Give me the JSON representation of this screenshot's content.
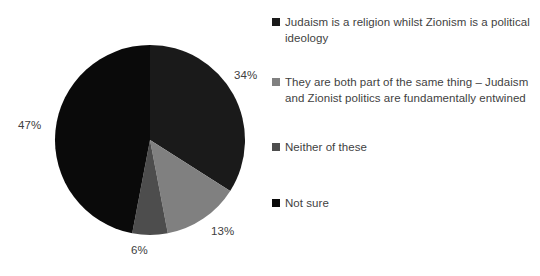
{
  "chart_data": {
    "type": "pie",
    "title": "",
    "subtitle": "",
    "xlabel": "",
    "ylabel": "",
    "legend_position": "right",
    "grid": false,
    "start_angle_deg": 0,
    "direction": "clockwise",
    "categories": [
      "Judaism is a religion whilst Zionism is a political ideology",
      "They are both part of the same thing – Judaism and Zionist politics are fundamentally entwined",
      "Neither of these",
      "Not sure"
    ],
    "values": [
      34,
      13,
      6,
      47
    ],
    "value_labels": [
      "34%",
      "13%",
      "6%",
      "47%"
    ],
    "colors": [
      "#1a1a1a",
      "#808080",
      "#4d4d4d",
      "#0a0a0a"
    ],
    "slices": [
      {
        "label": "Judaism is a religion whilst Zionism is a political ideology",
        "value": 34,
        "value_label": "34%",
        "color": "#1a1a1a"
      },
      {
        "label": "They are both part of the same thing – Judaism and Zionist politics are fundamentally entwined",
        "value": 13,
        "value_label": "13%",
        "color": "#808080"
      },
      {
        "label": "Neither of these",
        "value": 6,
        "value_label": "6%",
        "color": "#4d4d4d"
      },
      {
        "label": "Not sure",
        "value": 47,
        "value_label": "47%",
        "color": "#0a0a0a"
      }
    ]
  },
  "legend": {
    "items": [
      {
        "label": "Judaism is a religion whilst Zionism is a political ideology",
        "color": "#1a1a1a",
        "swatch_icon": "square-swatch-icon"
      },
      {
        "label": "They are both part of the same thing – Judaism and Zionist politics are fundamentally entwined",
        "color": "#808080",
        "swatch_icon": "square-swatch-icon"
      },
      {
        "label": "Neither of these",
        "color": "#4d4d4d",
        "swatch_icon": "square-swatch-icon"
      },
      {
        "label": "Not sure",
        "color": "#0a0a0a",
        "swatch_icon": "square-swatch-icon"
      }
    ]
  },
  "geometry": {
    "center_x": 150,
    "center_y": 140,
    "radius": 95
  }
}
